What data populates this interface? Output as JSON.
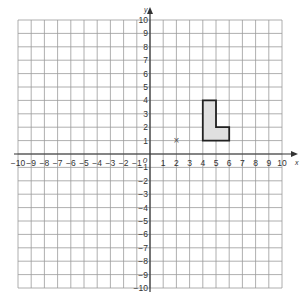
{
  "diagram": {
    "type": "coordinate-grid",
    "x_axis": {
      "label": "x",
      "min": -10,
      "max": 10,
      "ticks": [
        -10,
        -9,
        -8,
        -7,
        -6,
        -5,
        -4,
        -3,
        -2,
        -1,
        1,
        2,
        3,
        4,
        5,
        6,
        7,
        8,
        9,
        10
      ]
    },
    "y_axis": {
      "label": "y",
      "min": -10,
      "max": 10,
      "ticks": [
        10,
        9,
        8,
        7,
        6,
        5,
        4,
        3,
        2,
        1,
        -1,
        -2,
        -3,
        -4,
        -5,
        -6,
        -7,
        -8,
        -9,
        -10
      ]
    },
    "origin_label": "0",
    "shape": {
      "name": "L-shape",
      "vertices": [
        [
          4,
          1
        ],
        [
          6,
          1
        ],
        [
          6,
          2
        ],
        [
          5,
          2
        ],
        [
          5,
          4
        ],
        [
          4,
          4
        ]
      ],
      "fill": "#e0e0e0",
      "stroke": "#222222"
    },
    "point": {
      "x": 2,
      "y": 1,
      "marker": "×"
    },
    "colors": {
      "grid": "#9a9a9a",
      "axis": "#333333"
    }
  }
}
